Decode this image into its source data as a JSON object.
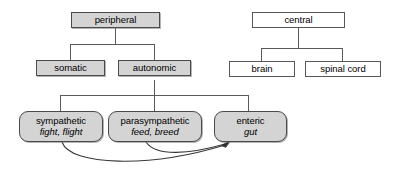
{
  "diagram": {
    "colors": {
      "filled_box_fill": "#d4d4d4",
      "filled_box_stroke": "#4a4a4a",
      "plain_box_fill": "#ffffff",
      "plain_box_stroke": "#58585a",
      "connector_stroke": "#555555",
      "arrow_stroke": "#333333",
      "background": "#ffffff"
    },
    "nodes": {
      "peripheral": {
        "label": "peripheral",
        "sub": "",
        "style": "filled-rect"
      },
      "somatic": {
        "label": "somatic",
        "sub": "",
        "style": "filled-rect"
      },
      "autonomic": {
        "label": "autonomic",
        "sub": "",
        "style": "filled-rect"
      },
      "sympathetic": {
        "label": "sympathetic",
        "sub": "fight, flight",
        "style": "filled-rounded"
      },
      "parasympathetic": {
        "label": "parasympathetic",
        "sub": "feed, breed",
        "style": "filled-rounded"
      },
      "enteric": {
        "label": "enteric",
        "sub": "gut",
        "style": "filled-rounded"
      },
      "central": {
        "label": "central",
        "sub": "",
        "style": "plain-rect"
      },
      "brain": {
        "label": "brain",
        "sub": "",
        "style": "plain-rect"
      },
      "spinal_cord": {
        "label": "spinal cord",
        "sub": "",
        "style": "plain-rect"
      }
    },
    "edges": [
      {
        "from": "peripheral",
        "to": "somatic",
        "kind": "bracket"
      },
      {
        "from": "peripheral",
        "to": "autonomic",
        "kind": "bracket"
      },
      {
        "from": "autonomic",
        "to": "sympathetic",
        "kind": "bracket"
      },
      {
        "from": "autonomic",
        "to": "parasympathetic",
        "kind": "bracket"
      },
      {
        "from": "autonomic",
        "to": "enteric",
        "kind": "bracket"
      },
      {
        "from": "central",
        "to": "brain",
        "kind": "bracket"
      },
      {
        "from": "central",
        "to": "spinal_cord",
        "kind": "bracket"
      },
      {
        "from": "sympathetic",
        "to": "enteric",
        "kind": "curved-arrow"
      },
      {
        "from": "parasympathetic",
        "to": "enteric",
        "kind": "curved-arrow"
      }
    ]
  }
}
